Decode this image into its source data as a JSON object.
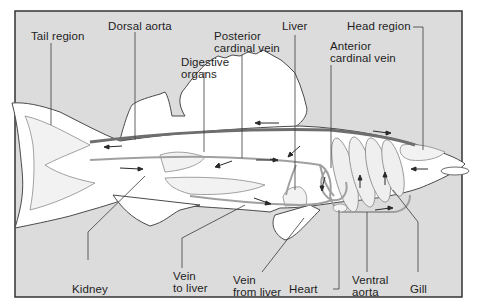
{
  "diagram": {
    "colors": {
      "background_panel": "#dcdcdc",
      "fish_body": "#ffffff",
      "outline": "#4a4a4a",
      "vessel": "#9a9a9a",
      "dorsal_aorta": "#6e6e6e",
      "leader_line": "#3a3a3a",
      "text": "#1e1e1e"
    },
    "labels": {
      "tail_region": "Tail region",
      "dorsal_aorta": "Dorsal aorta",
      "digestive_organs": "Digestive\norgans",
      "posterior_cardinal_vein": "Posterior\ncardinal vein",
      "liver": "Liver",
      "anterior_cardinal_vein": "Anterior\ncardinal vein",
      "head_region": "Head region",
      "kidney": "Kidney",
      "vein_to_liver": "Vein\nto liver",
      "vein_from_liver": "Vein\nfrom liver",
      "heart": "Heart",
      "ventral_aorta": "Ventral\naorta",
      "gill": "Gill"
    },
    "flow_arrows": [
      {
        "location": "tail upper vessel",
        "direction": "left"
      },
      {
        "location": "tail lower vessel",
        "direction": "right"
      },
      {
        "location": "dorsal aorta mid",
        "direction": "left"
      },
      {
        "location": "dorsal aorta front",
        "direction": "right"
      },
      {
        "location": "posterior cardinal vein",
        "direction": "right"
      },
      {
        "location": "digestive organs",
        "direction": "left"
      },
      {
        "location": "vein from liver",
        "direction": "right"
      },
      {
        "location": "heart",
        "direction": "down"
      },
      {
        "location": "gills",
        "direction": "up"
      },
      {
        "location": "ventral aorta",
        "direction": "right"
      },
      {
        "location": "head region",
        "direction": "left"
      }
    ]
  }
}
